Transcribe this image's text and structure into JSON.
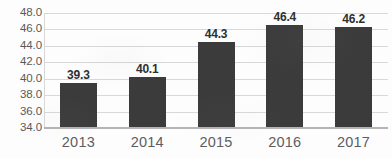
{
  "chart_data": {
    "type": "bar",
    "title": "",
    "subtitle": "",
    "xlabel": "",
    "ylabel": "",
    "categories": [
      "2013",
      "2014",
      "2015",
      "2016",
      "2017"
    ],
    "values": [
      39.3,
      40.1,
      44.3,
      46.4,
      46.2
    ],
    "data_labels": [
      "39.3",
      "40.1",
      "44.3",
      "46.4",
      "46.2"
    ],
    "ylim": [
      34.0,
      48.0
    ],
    "ytick_values": [
      48.0,
      46.0,
      44.0,
      42.0,
      40.0,
      38.0,
      36.0,
      34.0
    ],
    "ytick_labels": [
      "48.0",
      "46.0",
      "44.0",
      "42.0",
      "40.0",
      "38.0",
      "36.0",
      "34.0"
    ],
    "grid": true,
    "grid_axis": "y",
    "legend": false,
    "legend_position": "none",
    "bar_color": "#3b3b3b",
    "gridline_color": "#d8d8d8",
    "axis_color": "#b4b4b4",
    "label_color": "#2f2f2f",
    "tick_color": "#59595b",
    "background_color": "#fdfdfd"
  }
}
